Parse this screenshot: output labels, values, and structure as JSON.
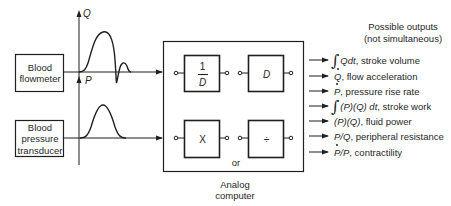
{
  "sources": {
    "flowmeter": {
      "line1": "Blood",
      "line2": "flowmeter"
    },
    "pressure": {
      "line1": "Blood",
      "line2": "pressure",
      "line3": "transducer"
    }
  },
  "axes": {
    "flow_label": "Q",
    "pressure_label": "P"
  },
  "analog_computer": {
    "label_line1": "Analog",
    "label_line2": "computer",
    "or_text": "or",
    "blocks": {
      "integrator": {
        "numerator": "1",
        "denominator": "D"
      },
      "differentiator": {
        "symbol": "D"
      },
      "multiplier": {
        "symbol": "X"
      },
      "divider": {
        "symbol": "÷"
      }
    }
  },
  "outputs": {
    "title_line1": "Possible outputs",
    "title_line2": "(not simultaneous)",
    "items": [
      {
        "integral": "∫",
        "symbol": "Qdt",
        "dot": "",
        "desc": ", stroke volume"
      },
      {
        "integral": "",
        "symbol": "Q",
        "dot": "dot",
        "desc": ", flow acceleration"
      },
      {
        "integral": "",
        "symbol": "P",
        "dot": "dot",
        "desc": ", pressure rise rate"
      },
      {
        "integral": "∫",
        "symbol": "(P)(Q) dt",
        "dot": "",
        "desc": ", stroke work"
      },
      {
        "integral": "",
        "symbol": "(P)(Q)",
        "dot": "",
        "desc": ", fluid power"
      },
      {
        "integral": "",
        "symbol": "P/Q",
        "dot": "",
        "desc": ", peripheral resistance"
      },
      {
        "integral": "",
        "symbol": "P/P",
        "dot": "dot",
        "desc": ", contractility"
      }
    ]
  },
  "colors": {
    "line": "#1f1f1f",
    "background": "#ffffff"
  }
}
